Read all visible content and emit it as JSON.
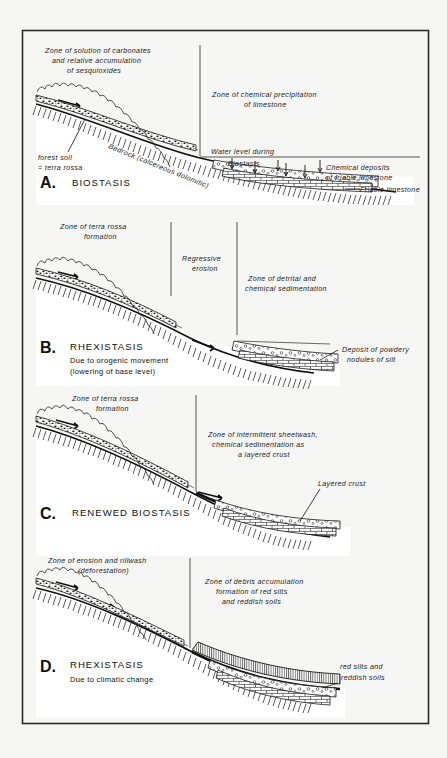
{
  "figure": {
    "background_color": "#f6f6f4",
    "ink_color": "#1a1a1a",
    "frame": {
      "x": 22,
      "y": 30,
      "width": 406,
      "height": 693
    }
  },
  "panels": [
    {
      "id": "A",
      "letter": "A.",
      "title": "BIOSTASIS",
      "subtitle": "",
      "labels": {
        "left_zone_line1": "Zone of solution of carbonates",
        "left_zone_line2": "and  relative  accumulation",
        "left_zone_line3": "of  sesquioxides",
        "right_zone_line1": "Zone of chemical precipitation",
        "right_zone_line2": "of limestone",
        "forest_soil_line1": "forest soil",
        "forest_soil_line2": "= terra rossa",
        "bedrock": "Bedrock (calcereous dolomitic)",
        "water_level_line1": "Water level during",
        "water_level_line2": "Biostasis",
        "chemical_deposits_line1": "Chemical  deposits",
        "chemical_deposits_line2": "of friable limestone",
        "friable_limestone": "Friable limestone"
      }
    },
    {
      "id": "B",
      "letter": "B.",
      "title": "RHEXISTASIS",
      "subtitle_line1": "Due to orogenic movement",
      "subtitle_line2": "(lowering of base level)",
      "labels": {
        "left_zone_line1": "Zone of terra rossa",
        "left_zone_line2": "formation",
        "mid_zone_line1": "Regressive",
        "mid_zone_line2": "erosion",
        "right_zone_line1": "Zone of detrital and",
        "right_zone_line2": "chemical sedimentation",
        "deposit_line1": "Deposit of powdery",
        "deposit_line2": "nodules of silt"
      }
    },
    {
      "id": "C",
      "letter": "C.",
      "title": "RENEWED BIOSTASIS",
      "subtitle": "",
      "labels": {
        "left_zone_line1": "Zone of terra rossa",
        "left_zone_line2": "formation",
        "right_zone_line1": "Zone of intermittent sheetwash,",
        "right_zone_line2": "chemical sedimentation as",
        "right_zone_line3": "a layered crust",
        "crust": "Layered crust"
      }
    },
    {
      "id": "D",
      "letter": "D.",
      "title": "RHEXISTASIS",
      "subtitle_line1": "Due to climatic change",
      "labels": {
        "left_zone_line1": "Zone of erosion and rillwash",
        "left_zone_line2": "(deforestation)",
        "right_zone_line1": "Zone of debris accumulation",
        "right_zone_line2": "formation of red silts",
        "right_zone_line3": "and reddish soils",
        "silts_line1": "red  silts  and",
        "silts_line2": "reddish soils"
      }
    }
  ]
}
